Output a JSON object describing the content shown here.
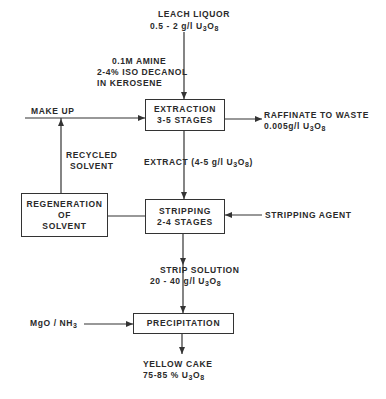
{
  "diagram": {
    "type": "process-flowchart",
    "inputs": {
      "leach_liquor": {
        "title": "LEACH LIQUOR",
        "concentration": "0.5 - 2 g/l U",
        "formula_sub": "3",
        "formula_tail": "O",
        "formula_sub2": "8"
      },
      "solvent": {
        "line1": "0.1M AMINE",
        "line2": "2-4% ISO DECANOL",
        "line3": "IN KEROSENE"
      },
      "make_up": "MAKE UP",
      "stripping_agent": "STRIPPING AGENT",
      "precipitant": {
        "text": "MgO / NH",
        "sub": "3"
      }
    },
    "boxes": {
      "extraction": {
        "line1": "EXTRACTION",
        "line2": "3-5 STAGES"
      },
      "stripping": {
        "line1": "STRIPPING",
        "line2": "2-4 STAGES"
      },
      "regeneration": {
        "line1": "REGENERATION",
        "line2": "OF",
        "line3": "SOLVENT"
      },
      "precipitation": {
        "line1": "PRECIPITATION"
      }
    },
    "streams": {
      "raffinate": {
        "title": "RAFFINATE TO WASTE",
        "concentration": "0.005g/l U",
        "sub": "3",
        "tail": "O",
        "sub2": "8"
      },
      "extract": {
        "text": "EXTRACT (4-5 g/l U",
        "sub": "3",
        "tail": "O",
        "sub2": "8",
        "close": ")"
      },
      "recycled_solvent": {
        "line1": "RECYCLED",
        "line2": "SOLVENT"
      },
      "strip_solution": {
        "title": "STRIP SOLUTION",
        "concentration": "20 - 40 g/l U",
        "sub": "3",
        "tail": "O",
        "sub2": "8"
      }
    },
    "output": {
      "yellow_cake": {
        "title": "YELLOW CAKE",
        "purity": "75-85 % U",
        "sub": "3",
        "tail": "O",
        "sub2": "8"
      }
    },
    "colors": {
      "ink": "#333333",
      "background": "#ffffff"
    }
  }
}
